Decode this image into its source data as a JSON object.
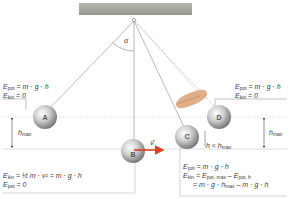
{
  "diagram": {
    "angle_label": "α",
    "balls": [
      {
        "id": "A",
        "label": "A",
        "cx": 45,
        "cy": 117
      },
      {
        "id": "B",
        "label": "B",
        "cx": 133,
        "cy": 151
      },
      {
        "id": "C",
        "label": "C",
        "cx": 187,
        "cy": 137
      },
      {
        "id": "D",
        "label": "D",
        "cx": 219,
        "cy": 117
      }
    ],
    "velocity_label": "v⃗",
    "h_max_label": "h",
    "h_max_sub": "max",
    "h_less_label": "h < h",
    "h_less_sub": "max",
    "annotations": {
      "A": {
        "line1": "E",
        "line1_sub": "pot",
        "line1_rest": " = m · g · h",
        "line2": "E",
        "line2_sub": "kin",
        "line2_rest": " = 0"
      },
      "D": {
        "line1": "E",
        "line1_sub": "pot",
        "line1_rest": " = m · g · h",
        "line2": "E",
        "line2_sub": "kin",
        "line2_rest": " = 0"
      },
      "B": {
        "line1": "E",
        "line1_sub": "kin",
        "line1_rest": " = ½ m · v² = m · g · h",
        "line2": "E",
        "line2_sub": "pot",
        "line2_rest": " = 0"
      },
      "C": {
        "line1": "E",
        "line1_sub": "pot",
        "line1_rest": " = m · g · h",
        "line2": "E",
        "line2_sub": "kin",
        "line2_rest": " = E",
        "line2_sub2": "pot, max",
        "line2_rest2": " – E",
        "line2_sub3": "pot, h",
        "line3": "= m · g · h",
        "line3_sub": "max",
        "line3_rest": " – m · g · h"
      }
    },
    "colors": {
      "ceiling": "#a8a8a0",
      "string": "#8a8a8a",
      "ball_light": "#f2f2f2",
      "ball_dark": "#7a7a7a",
      "arrow": "#e0401c",
      "guide": "#bfbfbf",
      "hand": "#d9a57a"
    }
  }
}
